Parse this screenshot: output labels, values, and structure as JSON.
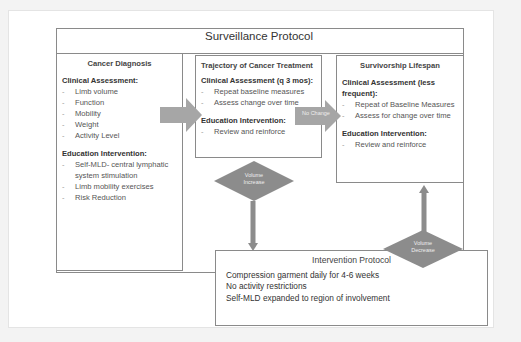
{
  "surveillance": {
    "title": "Surveillance Protocol"
  },
  "boxes": {
    "diagnosis": {
      "title": "Cancer Diagnosis",
      "clinical_heading": "Clinical Assessment:",
      "clinical_items": [
        "Limb volume",
        "Function",
        "Mobility",
        "Weight",
        "Activity Level"
      ],
      "education_heading": "Education Intervention:",
      "education_items": [
        "Self-MLD- central lymphatic system stimulation",
        "Limb mobility exercises",
        "Risk Reduction"
      ]
    },
    "trajectory": {
      "title": "Trajectory of Cancer Treatment",
      "clinical_heading": "Clinical Assessment (q 3 mos):",
      "clinical_items": [
        "Repeat baseline measures",
        "Assess change over time"
      ],
      "education_heading": "Education Intervention:",
      "education_items": [
        "Review and reinforce"
      ]
    },
    "survivorship": {
      "title": "Survivorship Lifespan",
      "clinical_heading": "Clinical Assessment (less frequent):",
      "clinical_items": [
        "Repeat of Baseline Measures",
        "Assess for change over time"
      ],
      "education_heading": "Education Intervention:",
      "education_items": [
        "Review and reinforce"
      ]
    }
  },
  "connectors": {
    "no_change": "No Change",
    "volume_increase": "Volume Increase",
    "volume_decrease": "Volume Decrease"
  },
  "intervention": {
    "title": "Intervention Protocol",
    "lines": [
      "Compression garment daily for 4-6 weeks",
      "No activity restrictions",
      "Self-MLD expanded to region of involvement"
    ]
  },
  "colors": {
    "arrow": "#a6a6a6",
    "diamond": "#8c8c8c",
    "border": "#8a8a8a"
  }
}
